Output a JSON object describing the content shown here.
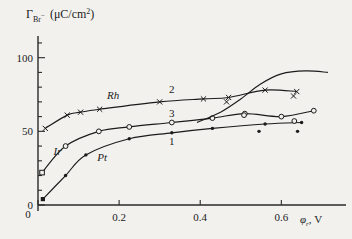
{
  "chart_data": {
    "type": "line",
    "title": "",
    "ylabel": "Γ_Br⁻ (μC/cm²)",
    "xlabel": "φ_r, V",
    "xlim": [
      0,
      0.72
    ],
    "ylim": [
      0,
      112
    ],
    "xticks": [
      0,
      0.2,
      0.4,
      0.6
    ],
    "xticklabels": [
      "0",
      "0.2",
      "0.4",
      "0.6"
    ],
    "yticks": [
      0,
      50,
      100
    ],
    "yticklabels": [
      "0",
      "50",
      "100"
    ],
    "yminorstep": 10,
    "grid": false,
    "legend": "inline-annotations",
    "series": [
      {
        "name": "Rh",
        "curve_number": "2",
        "marker": "cross",
        "points": [
          {
            "x": 0.018,
            "y": 52
          },
          {
            "x": 0.072,
            "y": 61
          },
          {
            "x": 0.105,
            "y": 63
          },
          {
            "x": 0.152,
            "y": 65
          },
          {
            "x": 0.3,
            "y": 70
          },
          {
            "x": 0.408,
            "y": 72
          },
          {
            "x": 0.47,
            "y": 73
          },
          {
            "x": 0.56,
            "y": 78
          },
          {
            "x": 0.638,
            "y": 77
          }
        ]
      },
      {
        "name": "Ir",
        "curve_number": "3",
        "marker": "open-circle",
        "points": [
          {
            "x": 0.01,
            "y": 22
          },
          {
            "x": 0.068,
            "y": 40
          },
          {
            "x": 0.15,
            "y": 50
          },
          {
            "x": 0.225,
            "y": 53
          },
          {
            "x": 0.33,
            "y": 56
          },
          {
            "x": 0.43,
            "y": 59
          },
          {
            "x": 0.51,
            "y": 62
          },
          {
            "x": 0.6,
            "y": 60
          },
          {
            "x": 0.68,
            "y": 64
          }
        ]
      },
      {
        "name": "Pt",
        "curve_number": "1",
        "marker": "filled-square",
        "points": [
          {
            "x": 0.012,
            "y": 4
          },
          {
            "x": 0.068,
            "y": 20
          },
          {
            "x": 0.118,
            "y": 34
          },
          {
            "x": 0.225,
            "y": 45
          },
          {
            "x": 0.33,
            "y": 49
          },
          {
            "x": 0.43,
            "y": 52
          },
          {
            "x": 0.56,
            "y": 55
          },
          {
            "x": 0.65,
            "y": 56
          }
        ]
      },
      {
        "name": "rising-branch",
        "curve_number": "",
        "marker": "none",
        "points": [
          {
            "x": 0.392,
            "y": 56
          },
          {
            "x": 0.45,
            "y": 63
          },
          {
            "x": 0.5,
            "y": 72
          },
          {
            "x": 0.548,
            "y": 82
          },
          {
            "x": 0.6,
            "y": 89
          },
          {
            "x": 0.66,
            "y": 91
          },
          {
            "x": 0.715,
            "y": 90
          }
        ]
      }
    ],
    "scatter_points": [
      {
        "x": 0.465,
        "y": 70,
        "marker": "cross"
      },
      {
        "x": 0.63,
        "y": 74,
        "marker": "cross"
      },
      {
        "x": 0.508,
        "y": 61,
        "marker": "open-circle"
      },
      {
        "x": 0.632,
        "y": 57,
        "marker": "open-circle"
      },
      {
        "x": 0.545,
        "y": 50,
        "marker": "filled-dot"
      },
      {
        "x": 0.64,
        "y": 50,
        "marker": "filled-dot"
      }
    ],
    "annotations": [
      {
        "text": "Rh",
        "x": 0.185,
        "y": 72,
        "style": "italic"
      },
      {
        "text": "2",
        "x": 0.33,
        "y": 76,
        "style": "plain"
      },
      {
        "text": "3",
        "x": 0.33,
        "y": 60,
        "style": "plain"
      },
      {
        "text": "1",
        "x": 0.33,
        "y": 41,
        "style": "plain"
      },
      {
        "text": "Ir",
        "x": 0.048,
        "y": 34,
        "style": "italic"
      },
      {
        "text": "Pt",
        "x": 0.158,
        "y": 30,
        "style": "italic"
      }
    ]
  },
  "axis": {
    "ylabel_gamma": "Γ",
    "ylabel_sub": "Br",
    "ylabel_sub_sup": "−",
    "ylabel_units": "(μC/cm",
    "ylabel_units_sup": "2",
    "ylabel_units_close": ")",
    "xlabel_phi": "φ",
    "xlabel_sub": "r",
    "xlabel_unit": ", V"
  },
  "colors": {
    "background": "#f2f1ee",
    "ink": "#1b1b1b",
    "axis": "#2a2a2a"
  }
}
